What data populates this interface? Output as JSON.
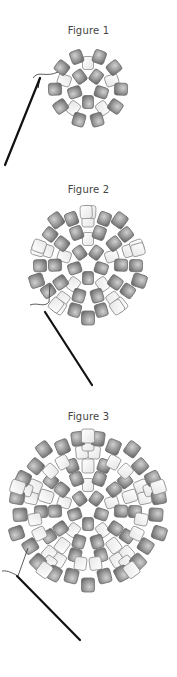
{
  "figures": [
    {
      "title": "Figure 1",
      "title_y": 25,
      "cx": 88,
      "cy": 88
    },
    {
      "title": "Figure 2",
      "title_y": 184,
      "cx": 88,
      "cy": 264
    },
    {
      "title": "Figure 3",
      "title_y": 411,
      "cx": 88,
      "cy": 510
    }
  ],
  "colors": {
    "dark_bead": "#8a8a8a",
    "dark_bead_light": "#c8c8c8",
    "light_bead": "#f4f4f4",
    "light_bead_edge": "#9a9a9a",
    "needle": "#111111",
    "title": "#444444"
  }
}
